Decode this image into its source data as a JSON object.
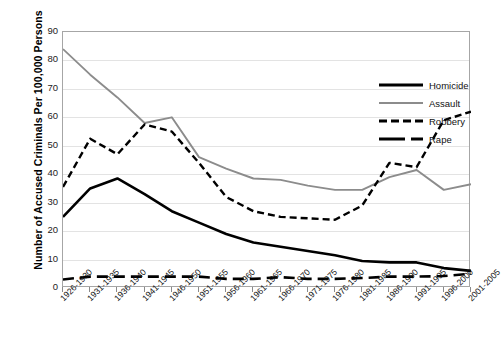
{
  "chart_data": {
    "type": "line",
    "title": "",
    "xlabel": "",
    "ylabel": "Number of Accused Criminals Per 100,000 Persons",
    "ylim": [
      0,
      90
    ],
    "yticks": [
      0,
      10,
      20,
      30,
      40,
      50,
      60,
      70,
      80,
      90
    ],
    "grid": true,
    "legend_position": "top-right inside plot",
    "categories": [
      "1926-1930",
      "1931-1935",
      "1936-1940",
      "1941-1945",
      "1946-1950",
      "1951-1955",
      "1956-1960",
      "1961-1965",
      "1966-1970",
      "1971-1975",
      "1976-1980",
      "1981-1985",
      "1986-1990",
      "1991-1995",
      "1996-2000",
      "2001-2005"
    ],
    "series": [
      {
        "name": "Homicide",
        "color": "#000000",
        "style": "solid",
        "values": [
          25,
          35,
          38.5,
          33,
          27,
          23,
          19,
          16,
          14.5,
          13,
          11.5,
          9.5,
          9,
          9,
          7,
          6
        ]
      },
      {
        "name": "Assault",
        "color": "#8c8c8c",
        "style": "solid",
        "values": [
          84,
          75,
          67,
          58,
          60,
          46,
          42,
          38.5,
          38,
          36,
          34.5,
          34.5,
          39,
          41.5,
          34.5,
          36.5
        ]
      },
      {
        "name": "Robbery",
        "color": "#000000",
        "style": "dashed",
        "values": [
          35.5,
          52.5,
          47,
          57.5,
          55,
          44,
          32,
          27,
          25,
          24.5,
          24,
          29,
          44,
          42.5,
          59,
          62
        ]
      },
      {
        "name": "Rape",
        "color": "#000000",
        "style": "long-dash",
        "values": [
          3,
          4,
          4,
          4,
          4,
          4,
          3.2,
          3.2,
          3.8,
          3.2,
          3.2,
          3.5,
          4,
          4,
          4.2,
          5
        ]
      }
    ]
  },
  "legend": {
    "items": [
      {
        "label": "Homicide"
      },
      {
        "label": "Assault"
      },
      {
        "label": "Robbery"
      },
      {
        "label": "Rape"
      }
    ]
  }
}
